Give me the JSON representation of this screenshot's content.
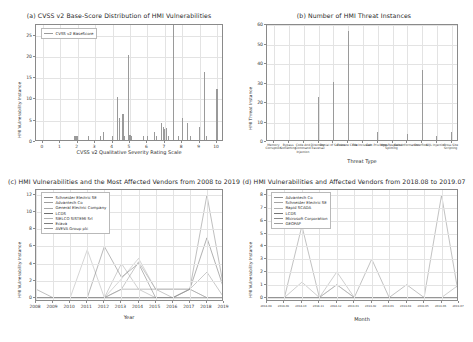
{
  "figure": {
    "background": "#ffffff",
    "bar_color": "#9a9a9a"
  },
  "chart_data": [
    {
      "id": "panel-a",
      "type": "bar",
      "title": "(a) CVSS v2 Base-Score Distribution of HMI Vulnerabilities",
      "xlabel": "CVSS v2 Qualitative Severity Rating Scale",
      "ylabel": "HMI Vulnerability Instance",
      "legend": [
        "CVSS v2 BaseScore"
      ],
      "legend_position": "upper left",
      "grid": true,
      "xlim": [
        -0.4,
        10.4
      ],
      "ylim": [
        0,
        27.5
      ],
      "xticks": [
        0,
        1,
        2,
        3,
        4,
        5,
        6,
        7,
        8,
        9,
        10
      ],
      "yticks": [
        0,
        5,
        10,
        15,
        20,
        25
      ],
      "x": [
        1.8,
        1.9,
        2.0,
        2.6,
        3.3,
        3.5,
        4.0,
        4.3,
        4.4,
        4.6,
        4.7,
        4.9,
        5.0,
        5.1,
        5.8,
        6.0,
        6.4,
        6.5,
        6.8,
        6.9,
        7.0,
        7.1,
        7.2,
        7.5,
        7.8,
        8.0,
        8.3,
        8.5,
        9.0,
        9.3,
        9.4,
        10.0
      ],
      "values": [
        1,
        1,
        1,
        1,
        1,
        2,
        1,
        10,
        5.2,
        6,
        1,
        20,
        1.2,
        1,
        1,
        1,
        2,
        1,
        4,
        3,
        2.6,
        2.8,
        1,
        27,
        1,
        5.1,
        4.1,
        1,
        3,
        16,
        1,
        12
      ]
    },
    {
      "id": "panel-b",
      "type": "bar",
      "title": "(b) Number of HMI Threat Instances",
      "xlabel": "Threat Type",
      "ylabel": "HMI Threat Instance",
      "grid": true,
      "ylim": [
        0,
        60
      ],
      "yticks": [
        0,
        10,
        20,
        30,
        40,
        50,
        60
      ],
      "categories": [
        "Memory Corruption",
        "Bypass Something",
        "Code And Command Injection",
        "Directory Traversal",
        "Denial of Service",
        "Execute Code",
        "File Inclusion",
        "Gain Privileges",
        "Http Response Splitting",
        "Gain Information",
        "Overflow",
        "SQL Injection",
        "Cross Site Scripting"
      ],
      "values": [
        0,
        0,
        0,
        22,
        30,
        56,
        0,
        4,
        0,
        3,
        36,
        2,
        4
      ]
    },
    {
      "id": "panel-c",
      "type": "line",
      "title": "(c) HMI Vulnerabilities and the Most Affected Vendors from 2008 to 2019",
      "xlabel": "Year",
      "ylabel": "HMI Vulnerability Instance",
      "grid": true,
      "legend_position": "upper left",
      "ylim": [
        -0.5,
        12.6
      ],
      "yticks": [
        0,
        2,
        4,
        6,
        8,
        10,
        12
      ],
      "x": [
        "2008",
        "2009",
        "2010",
        "2011",
        "2012",
        "2013",
        "2014",
        "2015",
        "2016",
        "2017",
        "2018",
        "2019"
      ],
      "series": [
        {
          "name": "Schneider Electric SE",
          "color": "#8a8a8a",
          "values": [
            1,
            0,
            0,
            0,
            0,
            1,
            1,
            1,
            1,
            1,
            12,
            1
          ]
        },
        {
          "name": "Advantech Co",
          "color": "#9e9e9e",
          "values": [
            0,
            0,
            0,
            0,
            0,
            0,
            0,
            0,
            0,
            1,
            3,
            0
          ]
        },
        {
          "name": "General Electric Company",
          "color": "#a8a8a8",
          "values": [
            0,
            0,
            0,
            0,
            0,
            4,
            1,
            0,
            0,
            0,
            0,
            0
          ]
        },
        {
          "name": "LCDS",
          "color": "#6f6f6f",
          "values": [
            0,
            0,
            0,
            0,
            0,
            0,
            0,
            0,
            0,
            1,
            7,
            1
          ]
        },
        {
          "name": "SIELCO SISTEMI Srl",
          "color": "#b2b2b2",
          "values": [
            0,
            0,
            0,
            5.6,
            0,
            2.2,
            4.6,
            1,
            1,
            1,
            0,
            0
          ]
        },
        {
          "name": "Ecava",
          "color": "#7d7d7d",
          "values": [
            0,
            0,
            0,
            0,
            6,
            2.4,
            4,
            0,
            0,
            0,
            0,
            0
          ]
        },
        {
          "name": "AVEVA Group plc",
          "color": "#999999",
          "values": [
            0,
            0,
            0,
            0,
            0,
            1,
            4.2,
            1,
            0,
            1,
            0,
            0
          ]
        }
      ]
    },
    {
      "id": "panel-d",
      "type": "line",
      "title": "(d) HMI Vulnerabilities and Affected Vendors from 2018.08 to 2019.07",
      "xlabel": "Month",
      "ylabel": "HMI Vulnerability Instance",
      "grid": true,
      "legend_position": "upper left",
      "ylim": [
        -0.35,
        8.4
      ],
      "yticks": [
        0,
        1,
        2,
        3,
        4,
        5,
        6,
        7,
        8
      ],
      "x": [
        "2018-08",
        "2018-09",
        "2018-10",
        "2018-11",
        "2018-12",
        "2019-01",
        "2019-02",
        "2019-03",
        "2019-04",
        "2019-05",
        "2019-06",
        "2019-07"
      ],
      "series": [
        {
          "name": "Advantech Co",
          "color": "#8f8f8f",
          "values": [
            0,
            0,
            5.6,
            0,
            1,
            0,
            3,
            0,
            1,
            0,
            8,
            0
          ]
        },
        {
          "name": "Schneider Electric SE",
          "color": "#a5a5a5",
          "values": [
            0,
            0,
            1.2,
            0,
            2,
            0,
            0,
            0,
            0,
            0,
            0,
            1
          ]
        },
        {
          "name": "Rapid SCADA",
          "color": "#b0b0b0",
          "values": [
            0,
            0,
            0,
            0,
            1,
            0,
            0,
            0,
            0,
            0,
            0,
            0
          ]
        },
        {
          "name": "LCDS",
          "color": "#757575",
          "values": [
            0,
            0,
            0,
            0,
            0,
            0,
            0,
            0,
            0,
            0,
            0,
            0
          ]
        },
        {
          "name": "Microsoft Corporation",
          "color": "#8a8a8a",
          "values": [
            0,
            0,
            0,
            0,
            0,
            0,
            0,
            0,
            0,
            0,
            0,
            0
          ]
        },
        {
          "name": "GEOFAP",
          "color": "#9c9c9c",
          "values": [
            0,
            0,
            0,
            0,
            0,
            0,
            0,
            0,
            0,
            0,
            0,
            0
          ]
        }
      ]
    }
  ]
}
